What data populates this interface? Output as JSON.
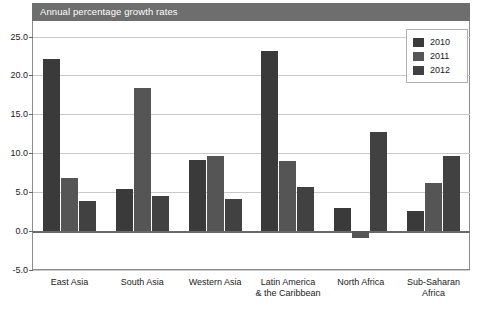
{
  "chart_data": {
    "type": "bar",
    "title": "Annual percentage growth rates",
    "xlabel": "",
    "ylabel": "",
    "ylim": [
      -5.0,
      27.0
    ],
    "yticks": [
      25.0,
      20.0,
      15.0,
      10.0,
      5.0,
      0.0,
      -5.0
    ],
    "ytick_labels": [
      "25.0",
      "20.0",
      "15.0",
      "10.0",
      "5.0",
      "0.0",
      "-5.0"
    ],
    "grid": true,
    "legend_position": "top-right",
    "categories": [
      "East Asia",
      "South Asia",
      "Western Asia",
      "Latin America\n& the Caribbean",
      "North Africa",
      "Sub-Saharan\nAfrica"
    ],
    "category_lines": [
      [
        "East Asia"
      ],
      [
        "South Asia"
      ],
      [
        "Western Asia"
      ],
      [
        "Latin America",
        "& the Caribbean"
      ],
      [
        "North Africa"
      ],
      [
        "Sub-Saharan",
        "Africa"
      ]
    ],
    "series": [
      {
        "name": "2010",
        "color": "#3a3a3a",
        "values": [
          22.1,
          5.4,
          9.1,
          23.2,
          3.0,
          2.6
        ]
      },
      {
        "name": "2011",
        "color": "#555555",
        "values": [
          6.8,
          18.4,
          9.6,
          9.0,
          -0.9,
          6.2
        ]
      },
      {
        "name": "2012",
        "color": "#414141",
        "values": [
          3.9,
          4.5,
          4.1,
          5.7,
          12.7,
          9.6
        ]
      }
    ]
  },
  "legend": {
    "items": [
      {
        "label": "2010"
      },
      {
        "label": "2011"
      },
      {
        "label": "2012"
      }
    ]
  },
  "colors": {
    "title_banner_bg": "#6e6e6e",
    "title_text": "#ffffff",
    "grid": "#c9c9c9",
    "axis": "#6a6a6a",
    "frame": "#8c8c8c"
  }
}
